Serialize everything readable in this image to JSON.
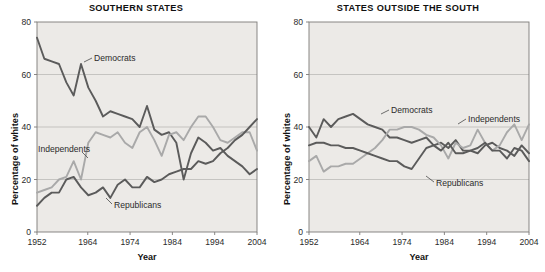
{
  "figure": {
    "background_color": "#ffffff",
    "plot_background_color": "#eceae7",
    "gridline_color": "#b5b3b0",
    "axis_color": "#7d7b78"
  },
  "colors": {
    "dark_line": "#5b5b5b",
    "light_line": "#a9a9a9",
    "text": "#111111"
  },
  "axis": {
    "ylabel": "Percentage of whites",
    "xlabel": "Year",
    "y_ticks": [
      "0",
      "20",
      "40",
      "60",
      "80"
    ],
    "x_ticks": [
      "1952",
      "1964",
      "1974",
      "1984",
      "1994",
      "2004"
    ]
  },
  "labels": {
    "democrats": "Democrats",
    "independents": "Independents",
    "republicans": "Republicans"
  },
  "chart_data": [
    {
      "type": "line",
      "title": "SOUTHERN STATES",
      "xlabel": "Year",
      "ylabel": "Percentage of whites",
      "xlim": [
        1952,
        2004
      ],
      "ylim": [
        0,
        80
      ],
      "grid": true,
      "legend_position": "inline-annotations",
      "x": [
        1952,
        1954,
        1956,
        1958,
        1960,
        1962,
        1964,
        1966,
        1968,
        1970,
        1972,
        1974,
        1976,
        1978,
        1980,
        1982,
        1984,
        1986,
        1988,
        1990,
        1992,
        1994,
        1996,
        1998,
        2000,
        2002,
        2004
      ],
      "series": [
        {
          "name": "Democrats",
          "color": "#5b5b5b",
          "values": [
            74,
            66,
            65,
            64,
            57,
            52,
            64,
            55,
            50,
            44,
            46,
            45,
            44,
            43,
            40,
            48,
            39,
            37,
            38,
            34,
            20,
            30,
            36,
            34,
            31,
            32,
            29,
            27,
            25,
            22,
            24
          ]
        },
        {
          "name": "Independents",
          "color": "#a9a9a9",
          "values": [
            15,
            16,
            17,
            20,
            21,
            27,
            20,
            34,
            38,
            37,
            36,
            38,
            34,
            32,
            38,
            40,
            35,
            29,
            37,
            38,
            35,
            40,
            44,
            44,
            40,
            35,
            34,
            36,
            38,
            38,
            31
          ]
        },
        {
          "name": "Republicans",
          "color": "#5b5b5b",
          "values": [
            10,
            13,
            15,
            15,
            20,
            21,
            17,
            14,
            15,
            17,
            13,
            18,
            20,
            17,
            17,
            21,
            19,
            20,
            22,
            23,
            24,
            24,
            27,
            26,
            27,
            30,
            32,
            35,
            37,
            40,
            43
          ]
        }
      ]
    },
    {
      "type": "line",
      "title": "STATES OUTSIDE THE SOUTH",
      "xlabel": "Year",
      "ylabel": "Percentage of whites",
      "xlim": [
        1952,
        2004
      ],
      "ylim": [
        0,
        80
      ],
      "grid": true,
      "legend_position": "inline-annotations",
      "x": [
        1952,
        1954,
        1956,
        1958,
        1960,
        1962,
        1964,
        1966,
        1968,
        1970,
        1972,
        1974,
        1976,
        1978,
        1980,
        1982,
        1984,
        1986,
        1988,
        1990,
        1992,
        1994,
        1996,
        1998,
        2000,
        2002,
        2004
      ],
      "series": [
        {
          "name": "Democrats",
          "color": "#5b5b5b",
          "values": [
            40,
            36,
            43,
            40,
            43,
            44,
            45,
            43,
            41,
            40,
            39,
            36,
            36,
            35,
            34,
            35,
            36,
            33,
            34,
            32,
            35,
            31,
            31,
            30,
            33,
            34,
            32,
            31,
            29,
            33,
            30
          ]
        },
        {
          "name": "Independents",
          "color": "#a9a9a9",
          "values": [
            27,
            29,
            23,
            25,
            25,
            26,
            26,
            28,
            30,
            32,
            35,
            39,
            39,
            40,
            40,
            39,
            37,
            36,
            33,
            28,
            34,
            32,
            33,
            39,
            34,
            31,
            33,
            38,
            41,
            35,
            41
          ]
        },
        {
          "name": "Republicans",
          "color": "#5b5b5b",
          "values": [
            33,
            34,
            34,
            33,
            33,
            32,
            32,
            31,
            30,
            29,
            28,
            27,
            27,
            25,
            24,
            28,
            32,
            33,
            31,
            34,
            30,
            30,
            31,
            32,
            34,
            31,
            31,
            28,
            32,
            31,
            27
          ]
        }
      ]
    }
  ]
}
